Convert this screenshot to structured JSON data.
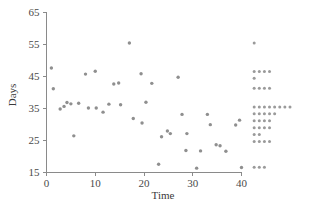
{
  "chart_data": {
    "type": "scatter",
    "title": "",
    "xlabel": "Time",
    "ylabel": "Days",
    "xlim": [
      0,
      44
    ],
    "ylim": [
      15,
      65
    ],
    "xticks": [
      0,
      10,
      20,
      30,
      40
    ],
    "yticks": [
      15,
      25,
      35,
      45,
      55,
      65
    ],
    "xtick_labels": [
      "0",
      "10",
      "20",
      "30",
      "40"
    ],
    "ytick_labels": [
      "15",
      "25",
      "35",
      "45",
      "55",
      "65"
    ],
    "grid": false,
    "legend": "none",
    "marker": "filled-circle",
    "marker_color": "#8f8f8f",
    "axis_color": "#8a8a8a",
    "points": [
      {
        "x": 1.0,
        "y": 47.5
      },
      {
        "x": 1.4,
        "y": 41.0
      },
      {
        "x": 2.8,
        "y": 34.7
      },
      {
        "x": 3.6,
        "y": 35.5
      },
      {
        "x": 4.2,
        "y": 36.7
      },
      {
        "x": 5.0,
        "y": 36.3
      },
      {
        "x": 5.6,
        "y": 26.3
      },
      {
        "x": 6.6,
        "y": 36.5
      },
      {
        "x": 8.0,
        "y": 45.6
      },
      {
        "x": 8.6,
        "y": 35.0
      },
      {
        "x": 10.0,
        "y": 46.5
      },
      {
        "x": 10.2,
        "y": 35.0
      },
      {
        "x": 11.6,
        "y": 33.7
      },
      {
        "x": 12.8,
        "y": 36.2
      },
      {
        "x": 13.8,
        "y": 42.5
      },
      {
        "x": 14.8,
        "y": 42.8
      },
      {
        "x": 15.2,
        "y": 36.0
      },
      {
        "x": 17.0,
        "y": 55.3
      },
      {
        "x": 17.8,
        "y": 31.7
      },
      {
        "x": 19.4,
        "y": 45.7
      },
      {
        "x": 19.6,
        "y": 30.3
      },
      {
        "x": 20.4,
        "y": 36.8
      },
      {
        "x": 21.6,
        "y": 42.7
      },
      {
        "x": 23.0,
        "y": 17.4
      },
      {
        "x": 23.6,
        "y": 26.0
      },
      {
        "x": 24.8,
        "y": 27.8
      },
      {
        "x": 25.4,
        "y": 27.0
      },
      {
        "x": 27.0,
        "y": 44.6
      },
      {
        "x": 27.8,
        "y": 33.0
      },
      {
        "x": 28.6,
        "y": 21.7
      },
      {
        "x": 28.8,
        "y": 27.0
      },
      {
        "x": 30.8,
        "y": 16.2
      },
      {
        "x": 31.6,
        "y": 21.6
      },
      {
        "x": 33.0,
        "y": 33.0
      },
      {
        "x": 33.6,
        "y": 29.8
      },
      {
        "x": 34.8,
        "y": 23.5
      },
      {
        "x": 35.6,
        "y": 23.2
      },
      {
        "x": 36.8,
        "y": 21.5
      },
      {
        "x": 38.8,
        "y": 29.7
      },
      {
        "x": 39.6,
        "y": 31.2
      },
      {
        "x": 40.0,
        "y": 16.4
      }
    ],
    "marginal_dot_histogram": {
      "description": "Stacked dot rows along the right margin showing the distribution of Days",
      "position": "right",
      "start_x": 42.6,
      "dot_spacing_x": 1.05,
      "rows": [
        {
          "value": 55.3,
          "count": 1
        },
        {
          "value": 46.4,
          "count": 4
        },
        {
          "value": 44.3,
          "count": 1
        },
        {
          "value": 41.2,
          "count": 4
        },
        {
          "value": 35.3,
          "count": 8
        },
        {
          "value": 33.2,
          "count": 5
        },
        {
          "value": 31.0,
          "count": 4
        },
        {
          "value": 28.8,
          "count": 4
        },
        {
          "value": 26.7,
          "count": 2
        },
        {
          "value": 24.5,
          "count": 4
        },
        {
          "value": 16.5,
          "count": 3
        }
      ]
    }
  },
  "figure": {
    "xlabel": "Time",
    "ylabel": "Days"
  }
}
